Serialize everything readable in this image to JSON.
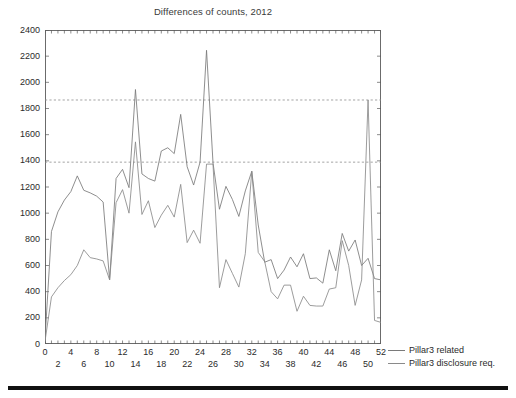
{
  "chart_data": {
    "type": "line",
    "title": "Differences of counts, 2012",
    "xlabel": "",
    "ylabel": "",
    "xlim": [
      0,
      52
    ],
    "ylim": [
      0,
      2400
    ],
    "ytick_step": 200,
    "yticks": [
      0,
      200,
      400,
      600,
      800,
      1000,
      1200,
      1400,
      1600,
      1800,
      2000,
      2200,
      2400
    ],
    "xticks": [
      0,
      2,
      4,
      6,
      8,
      10,
      12,
      14,
      16,
      18,
      20,
      22,
      24,
      26,
      28,
      30,
      32,
      34,
      36,
      38,
      40,
      42,
      44,
      46,
      48,
      50,
      52
    ],
    "xticks_row0": [
      0,
      4,
      8,
      12,
      16,
      20,
      24,
      28,
      32,
      36,
      40,
      44,
      48,
      52
    ],
    "xticks_row1": [
      2,
      6,
      10,
      14,
      18,
      22,
      26,
      30,
      34,
      38,
      42,
      46,
      50
    ],
    "grid": false,
    "legend_position": "right-outside",
    "reference_lines": [
      {
        "name": "upper-reference-line",
        "value": 1865,
        "style": "dashed",
        "color": "#8c8c8c"
      },
      {
        "name": "lower-reference-line",
        "value": 1390,
        "style": "dashed",
        "color": "#8c8c8c"
      }
    ],
    "x": [
      0,
      1,
      2,
      3,
      4,
      5,
      6,
      7,
      8,
      9,
      10,
      11,
      12,
      13,
      14,
      15,
      16,
      17,
      18,
      19,
      20,
      21,
      22,
      23,
      24,
      25,
      26,
      27,
      28,
      29,
      30,
      31,
      32,
      33,
      34,
      35,
      36,
      37,
      38,
      39,
      40,
      41,
      42,
      43,
      44,
      45,
      46,
      47,
      48,
      49,
      50,
      51,
      52
    ],
    "series": [
      {
        "name": "Pillar3 related",
        "color": "#7a7a7a",
        "values": [
          35,
          860,
          1010,
          1100,
          1165,
          1285,
          1175,
          1155,
          1130,
          1085,
          490,
          1265,
          1335,
          1195,
          1945,
          1300,
          1265,
          1245,
          1475,
          1500,
          1455,
          1755,
          1355,
          1215,
          1390,
          2245,
          1385,
          1030,
          1205,
          1105,
          975,
          1170,
          1320,
          910,
          625,
          645,
          500,
          565,
          665,
          590,
          690,
          500,
          505,
          465,
          720,
          560,
          845,
          710,
          795,
          600,
          655,
          500,
          490
        ]
      },
      {
        "name": "Pillar3 disclosure req.",
        "color": "#8a8a8a",
        "values": [
          20,
          360,
          430,
          485,
          530,
          600,
          720,
          660,
          650,
          635,
          490,
          1080,
          1180,
          1000,
          1545,
          990,
          1095,
          890,
          985,
          1060,
          970,
          1220,
          775,
          870,
          770,
          1375,
          1375,
          430,
          645,
          540,
          435,
          690,
          1320,
          700,
          630,
          400,
          345,
          450,
          450,
          250,
          365,
          295,
          290,
          290,
          420,
          430,
          790,
          600,
          295,
          490,
          1865,
          180,
          165
        ]
      }
    ],
    "series_secondary_tail": {
      "name": "Pillar3 related tail",
      "values": [
        52,
        1865,
        1865,
        500,
        470
      ]
    }
  },
  "legend": {
    "items": [
      {
        "label": "Pillar3 related",
        "color": "#7a7a7a"
      },
      {
        "label": "Pillar3 disclosure req.",
        "color": "#8a8a8a"
      }
    ]
  }
}
